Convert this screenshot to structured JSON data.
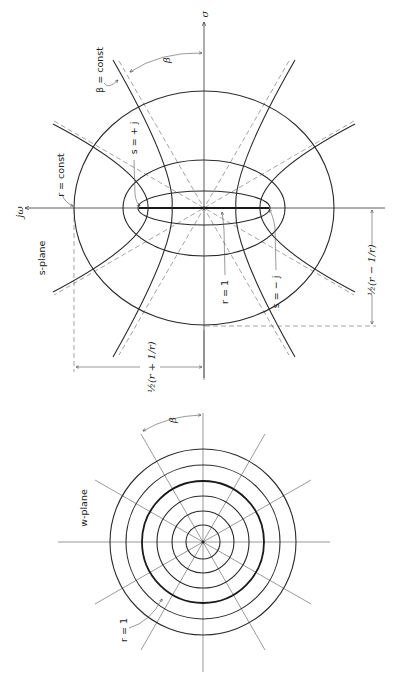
{
  "s_plane": {
    "title": "s-plane",
    "axis_sigma": "σ",
    "axis_jomega": "jω",
    "label_r_const": "r = const",
    "label_beta_const": "β = const",
    "label_beta": "β",
    "label_s_plus_j": "s = + j",
    "label_s_minus_j": "s = − j",
    "label_r_1": "r = 1",
    "dim_r_plus": "½(r + 1/r)",
    "dim_r_minus": "½(r − 1/r)"
  },
  "w_plane": {
    "title": "w-plane",
    "label_beta": "β",
    "label_r_1": "r = 1",
    "circle_count": 6,
    "radial_line_step_deg": 30
  }
}
